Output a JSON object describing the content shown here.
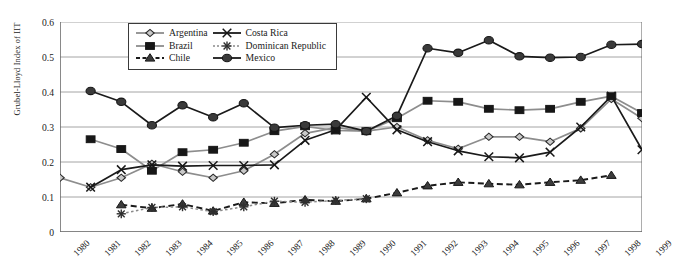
{
  "chart_data": {
    "type": "line",
    "title": "",
    "xlabel": "",
    "ylabel": "Grubel-Lloyd Index of IIT",
    "x": [
      1980,
      1981,
      1982,
      1983,
      1984,
      1985,
      1986,
      1987,
      1988,
      1989,
      1990,
      1991,
      1992,
      1993,
      1994,
      1995,
      1996,
      1997,
      1998,
      1999
    ],
    "xtick_labels": [
      "1980",
      "1981",
      "1982",
      "1983",
      "1984",
      "1985",
      "1986",
      "1987",
      "1988",
      "1989",
      "1990",
      "1991",
      "1992",
      "1993",
      "1994",
      "1995",
      "1996",
      "1997",
      "1998",
      "1999"
    ],
    "ytick_labels": [
      "0",
      "0.1",
      "0.2",
      "0.3",
      "0.4",
      "0.5",
      "0.6"
    ],
    "ytick_values": [
      0,
      0.1,
      0.2,
      0.3,
      0.4,
      0.5,
      0.6
    ],
    "ylim": [
      0,
      0.6
    ],
    "xlim": [
      1980,
      1999
    ],
    "grid": "horizontal",
    "legend_position": "top-center",
    "series": [
      {
        "name": "Argentina",
        "marker": "diamond-open",
        "line": "solid-grey",
        "color": "#8a8a8a",
        "x": [
          1980,
          1981,
          1982,
          1983,
          1984,
          1985,
          1986,
          1987,
          1988,
          1989,
          1990,
          1991,
          1992,
          1993,
          1994,
          1995,
          1996,
          1997,
          1998,
          1999
        ],
        "values": [
          0.155,
          0.128,
          0.155,
          0.195,
          0.172,
          0.155,
          0.175,
          0.222,
          0.282,
          0.298,
          0.288,
          0.3,
          0.262,
          0.238,
          0.272,
          0.272,
          0.258,
          0.296,
          0.38,
          0.325
        ]
      },
      {
        "name": "Brazil",
        "marker": "square-filled",
        "line": "solid-grey",
        "color": "#8a8a8a",
        "x": [
          1981,
          1982,
          1983,
          1984,
          1985,
          1986,
          1987,
          1988,
          1989,
          1990,
          1991,
          1992,
          1993,
          1994,
          1995,
          1996,
          1997,
          1998,
          1999
        ],
        "values": [
          0.265,
          0.237,
          0.175,
          0.228,
          0.235,
          0.255,
          0.288,
          0.302,
          0.29,
          0.288,
          0.325,
          0.375,
          0.372,
          0.352,
          0.348,
          0.352,
          0.372,
          0.388,
          0.34
        ]
      },
      {
        "name": "Chile",
        "marker": "triangle-filled",
        "line": "dashed-black",
        "color": "#1a1a1a",
        "x": [
          1982,
          1983,
          1984,
          1985,
          1986,
          1987,
          1988,
          1989,
          1990,
          1991,
          1992,
          1993,
          1994,
          1995,
          1996,
          1997,
          1998
        ],
        "values": [
          0.078,
          0.068,
          0.08,
          0.06,
          0.085,
          0.082,
          0.092,
          0.088,
          0.095,
          0.112,
          0.132,
          0.142,
          0.138,
          0.135,
          0.142,
          0.148,
          0.162
        ]
      },
      {
        "name": "Costa Rica",
        "marker": "x-cross",
        "line": "solid-black",
        "color": "#1a1a1a",
        "x": [
          1981,
          1982,
          1983,
          1984,
          1985,
          1986,
          1987,
          1988,
          1989,
          1990,
          1991,
          1992,
          1993,
          1994,
          1995,
          1996,
          1997,
          1998,
          1999
        ],
        "values": [
          0.128,
          0.178,
          0.192,
          0.188,
          0.19,
          0.19,
          0.192,
          0.262,
          0.292,
          0.385,
          0.292,
          0.258,
          0.232,
          0.215,
          0.212,
          0.228,
          0.3,
          0.388,
          0.235
        ]
      },
      {
        "name": "Dominican Republic",
        "marker": "asterisk",
        "line": "dotted-grey",
        "color": "#6e6e6e",
        "x": [
          1982,
          1983,
          1984,
          1985,
          1986,
          1987,
          1988,
          1989,
          1990
        ],
        "values": [
          0.052,
          0.07,
          0.072,
          0.058,
          0.072,
          0.088,
          0.085,
          0.09,
          0.095
        ]
      },
      {
        "name": "Mexico",
        "marker": "circle-filled",
        "line": "solid-black",
        "color": "#1a1a1a",
        "x": [
          1981,
          1982,
          1983,
          1984,
          1985,
          1986,
          1987,
          1988,
          1989,
          1990,
          1991,
          1992,
          1993,
          1994,
          1995,
          1996,
          1997,
          1998,
          1999
        ],
        "values": [
          0.403,
          0.372,
          0.305,
          0.362,
          0.328,
          0.368,
          0.298,
          0.305,
          0.308,
          0.288,
          0.332,
          0.525,
          0.512,
          0.548,
          0.502,
          0.498,
          0.5,
          0.535,
          0.537
        ]
      }
    ]
  },
  "legend": {
    "entries": [
      {
        "label": "Argentina"
      },
      {
        "label": "Costa Rica"
      },
      {
        "label": "Brazil"
      },
      {
        "label": "Dominican Republic"
      },
      {
        "label": "Chile"
      },
      {
        "label": "Mexico"
      }
    ]
  }
}
